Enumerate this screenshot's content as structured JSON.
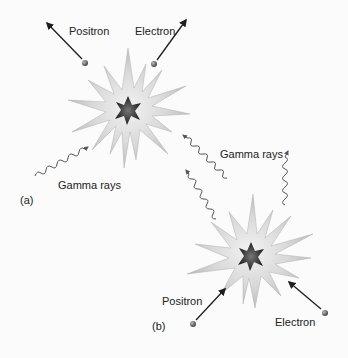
{
  "figure": {
    "panel_a": {
      "tag": "(a)",
      "positron_label": "Positron",
      "electron_label": "Electron",
      "gamma_label": "Gamma rays"
    },
    "gamma_shared": {
      "gamma_label": "Gamma rays"
    },
    "panel_b": {
      "tag": "(b)",
      "positron_label": "Positron",
      "electron_label": "Electron"
    }
  },
  "colors": {
    "background": "#fbfbfb",
    "burst_outer": "#c9c9c9",
    "burst_inner": "#e4e4e4",
    "core": "#2c2c2c",
    "particle": "#6a6a6a",
    "arrow": "#1e1e1e",
    "wave": "#555555"
  }
}
